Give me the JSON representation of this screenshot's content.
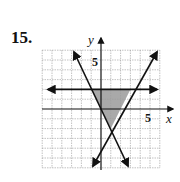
{
  "problem": {
    "number": "15."
  },
  "graph": {
    "x_label": "x",
    "y_label": "y",
    "x_tick_label": "5",
    "y_tick_label": "5",
    "grid_range": {
      "xmin": -6,
      "xmax": 6,
      "ymin": -6,
      "ymax": 6
    },
    "lines": [
      {
        "name": "horizontal",
        "equation": "y = 2"
      },
      {
        "name": "decreasing",
        "equation": "y = -2x"
      },
      {
        "name": "increasing",
        "equation": "y = 2x - 4"
      }
    ],
    "shaded_region": {
      "vertices": [
        [
          -1,
          2
        ],
        [
          3,
          2
        ],
        [
          1,
          -2
        ]
      ],
      "color": "#9a9a9a"
    }
  }
}
